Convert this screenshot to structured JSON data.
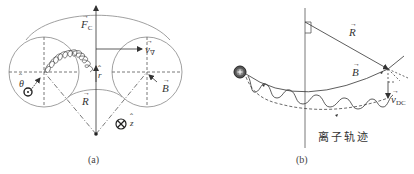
{
  "figure_a": {
    "caption": "(a)",
    "labels": {
      "force_curvature": "F",
      "force_curvature_sub": "C",
      "velocity_grad": "v",
      "velocity_grad_sub": "∇",
      "radius_unit": "r",
      "radius_vector": "R",
      "magnetic_field": "B",
      "theta_unit": "θ",
      "z_unit": "z"
    },
    "symbols": {
      "out_of_page": "⊙",
      "into_page": "⊗"
    }
  },
  "figure_b": {
    "caption": "(b)",
    "trajectory_label": "离子轨迹",
    "labels": {
      "radius_vector": "R",
      "magnetic_field": "B",
      "drift_velocity": "v",
      "drift_velocity_sub": "DC"
    },
    "ion_symbol": "+"
  },
  "colors": {
    "line": "#333333",
    "dashed": "#555555",
    "background": "#ffffff"
  }
}
